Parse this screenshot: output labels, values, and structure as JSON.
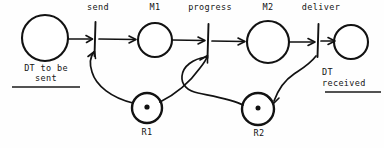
{
  "diagram": {
    "kind": "petri-net",
    "title_visible": false,
    "background_color": "#fefefe",
    "ink_color": "#121212",
    "width": 384,
    "height": 148,
    "transitions": [
      {
        "id": "send",
        "label": "send",
        "x": 95,
        "label_x": 96,
        "label_y": 4
      },
      {
        "id": "progress",
        "label": "progress",
        "x": 208,
        "label_x": 210,
        "label_y": 4
      },
      {
        "id": "deliver",
        "label": "deliver",
        "x": 318,
        "label_x": 320,
        "label_y": 4
      }
    ],
    "places": [
      {
        "id": "dt-to-be-sent",
        "label": "DT to be\nsent",
        "cx": 45,
        "cy": 38,
        "r": 23,
        "token": false,
        "underlined": true,
        "label_pos": "below"
      },
      {
        "id": "m1",
        "label": "M1",
        "cx": 155,
        "cy": 40,
        "r": 17,
        "token": false,
        "underlined": false,
        "label_pos": "above"
      },
      {
        "id": "m2",
        "label": "M2",
        "cx": 268,
        "cy": 42,
        "r": 21,
        "token": false,
        "underlined": false,
        "label_pos": "above"
      },
      {
        "id": "dt-received",
        "label": "DT\nreceived",
        "cx": 351,
        "cy": 42,
        "r": 17,
        "token": false,
        "underlined": true,
        "label_pos": "below"
      },
      {
        "id": "r1",
        "label": "R1",
        "cx": 147,
        "cy": 108,
        "r": 15,
        "token": true,
        "underlined": false,
        "label_pos": "below"
      },
      {
        "id": "r2",
        "label": "R2",
        "cx": 258,
        "cy": 109,
        "r": 16,
        "token": true,
        "underlined": false,
        "label_pos": "below"
      }
    ],
    "labels": {
      "send": "send",
      "m1": "M1",
      "progress": "progress",
      "m2": "M2",
      "deliver": "deliver",
      "dt_to_be_sent_line1": "DT to be",
      "dt_to_be_sent_line2": "sent",
      "dt_received_line1": "DT",
      "dt_received_line2": "received",
      "r1": "R1",
      "r2": "R2"
    },
    "arcs": [
      {
        "id": "arc-dtsent-send",
        "from": "dt-to-be-sent",
        "to": "send",
        "style": "straight",
        "arrow": true
      },
      {
        "id": "arc-send-m1",
        "from": "send",
        "to": "m1",
        "style": "straight",
        "arrow": true
      },
      {
        "id": "arc-m1-progress",
        "from": "m1",
        "to": "progress",
        "style": "straight",
        "arrow": true
      },
      {
        "id": "arc-progress-m2",
        "from": "progress",
        "to": "m2",
        "style": "straight",
        "arrow": true
      },
      {
        "id": "arc-m2-deliver",
        "from": "m2",
        "to": "deliver",
        "style": "straight",
        "arrow": true
      },
      {
        "id": "arc-deliver-dtrecv",
        "from": "deliver",
        "to": "dt-received",
        "style": "straight",
        "arrow": true
      },
      {
        "id": "arc-r1-send",
        "from": "r1",
        "to": "send",
        "style": "curve",
        "arrow": true
      },
      {
        "id": "arc-r1-progress",
        "from": "r1",
        "to": "progress",
        "style": "curve",
        "arrow": true
      },
      {
        "id": "arc-progress-r2",
        "from": "progress",
        "to": "r2",
        "style": "curve",
        "arrow": false
      },
      {
        "id": "arc-deliver-r2",
        "from": "deliver",
        "to": "r2",
        "style": "curve",
        "arrow": true
      }
    ]
  }
}
